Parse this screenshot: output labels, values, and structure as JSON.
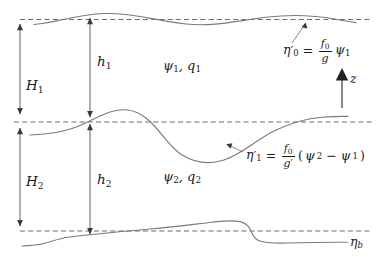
{
  "figure": {
    "background_color": "#ffffff",
    "curve_color": "#7a7a7a",
    "dashed_color": "#5a5a5a",
    "text_color": "#1a1a1a"
  },
  "depth_labels": {
    "H1": "H",
    "H1_sub": "1",
    "H2": "H",
    "H2_sub": "2",
    "h1": "h",
    "h1_sub": "1",
    "h2": "h",
    "h2_sub": "2"
  },
  "layers": [
    {
      "name": "upper-layer",
      "streamfunction": "ψ",
      "streamfunction_sub": "1",
      "pv": "q",
      "pv_sub": "1",
      "separator": ", "
    },
    {
      "name": "lower-layer",
      "streamfunction": "ψ",
      "streamfunction_sub": "2",
      "pv": "q",
      "pv_sub": "2",
      "separator": ", "
    }
  ],
  "equations": {
    "free_surface": {
      "lhs_symbol": "η",
      "lhs_prime": "′",
      "lhs_sub": "0",
      "equals": "=",
      "numerator": "f",
      "numerator_sub": "0",
      "denominator": "g",
      "denominator_prime": "",
      "rhs_symbol": "ψ",
      "rhs_sub": "1",
      "full_text": "η′0 = (f0/g) ψ1"
    },
    "interface": {
      "lhs_symbol": "η",
      "lhs_prime": "′",
      "lhs_sub": "1",
      "equals": "=",
      "numerator": "f",
      "numerator_sub": "0",
      "denominator": "g",
      "denominator_prime": "′",
      "open_paren": "(",
      "term1_symbol": "ψ",
      "term1_sub": "2",
      "minus": "−",
      "term2_symbol": "ψ",
      "term2_sub": "1",
      "close_paren": ")",
      "full_text": "η′1 = (f0/g′)(ψ2 − ψ1)"
    }
  },
  "bottom_label": {
    "symbol": "η",
    "sub": "b"
  },
  "axis": {
    "label": "z",
    "direction": "up"
  }
}
